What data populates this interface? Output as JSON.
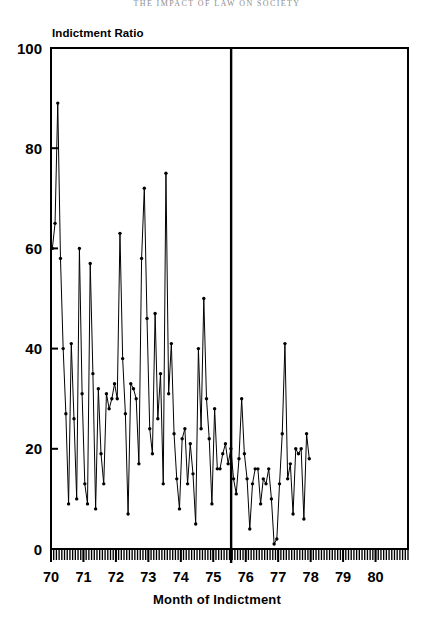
{
  "running_head": "THE IMPACT OF LAW ON SOCIETY",
  "caption": "",
  "axis": {
    "y_title": "Indictment Ratio",
    "x_title": "Month of Indictment"
  },
  "chart_data": {
    "type": "line",
    "title": "",
    "subtitle": "",
    "xlabel": "Month of Indictment",
    "ylabel": "Indictment Ratio",
    "ylim": [
      0,
      100
    ],
    "yticks": [
      0,
      20,
      40,
      60,
      80,
      100
    ],
    "xlim": [
      1970.0,
      1981.0
    ],
    "xticks": [
      1970,
      1971,
      1972,
      1973,
      1974,
      1975,
      1976,
      1977,
      1978,
      1979,
      1980
    ],
    "xticklabels": [
      "70",
      "71",
      "72",
      "73",
      "74",
      "75",
      "76",
      "77",
      "78",
      "79",
      "80"
    ],
    "x_minor_ticks": "monthly",
    "grid": false,
    "legend": false,
    "markers": "filled-circle",
    "annotations": [
      {
        "name": "intervention-line",
        "type": "vertical-line",
        "x": 1975.55,
        "label": ""
      }
    ],
    "series": [
      {
        "name": "Indictment Ratio",
        "x_start": "1970-01",
        "x_step_months": 1,
        "values": [
          60,
          65,
          89,
          58,
          40,
          27,
          9,
          41,
          26,
          10,
          60,
          31,
          13,
          9,
          57,
          35,
          8,
          32,
          19,
          13,
          31,
          28,
          30,
          33,
          30,
          63,
          38,
          27,
          7,
          33,
          32,
          30,
          17,
          58,
          72,
          46,
          24,
          19,
          47,
          26,
          35,
          13,
          75,
          31,
          41,
          23,
          14,
          8,
          22,
          24,
          13,
          21,
          15,
          5,
          40,
          24,
          50,
          30,
          22,
          9,
          28,
          16,
          16,
          19,
          21,
          17,
          20,
          14,
          11,
          18,
          30,
          19,
          14,
          4,
          13,
          16,
          16,
          9,
          14,
          13,
          16,
          10,
          1,
          2,
          13,
          23,
          41,
          14,
          17,
          7,
          20,
          19,
          20,
          6,
          23,
          18
        ]
      }
    ]
  }
}
